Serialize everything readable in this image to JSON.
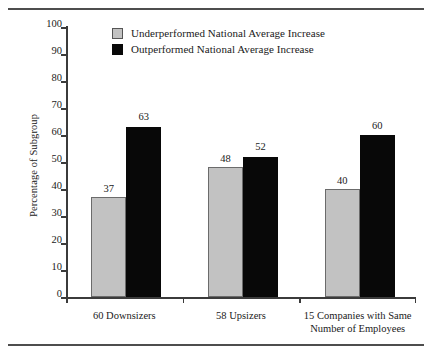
{
  "chart_data": {
    "type": "bar",
    "title": "",
    "subtitle": "",
    "xlabel": "",
    "ylabel": "Percentage of Subgroup",
    "ylim": [
      0,
      100
    ],
    "ytick_step": 10,
    "yticks": [
      0,
      10,
      20,
      30,
      40,
      50,
      60,
      70,
      80,
      90,
      100
    ],
    "grid": false,
    "legend_position": "top-center",
    "categories": [
      "60 Downsizers",
      "58 Upsizers",
      "15 Companies with Same Number of Employees"
    ],
    "category_lines": [
      [
        "60 Downsizers"
      ],
      [
        "58 Upsizers"
      ],
      [
        "15 Companies with Same",
        "Number of Employees"
      ]
    ],
    "series": [
      {
        "name": "Underperformed National Average Increase",
        "color": "#c2c2c2",
        "values": [
          37,
          48,
          40
        ]
      },
      {
        "name": "Outperformed National Average Increase",
        "color": "#080808",
        "values": [
          63,
          52,
          60
        ]
      }
    ]
  },
  "legend": {
    "items": [
      {
        "label": "Underperformed National Average Increase",
        "swatch": "under"
      },
      {
        "label": "Outperformed National Average Increase",
        "swatch": "over"
      }
    ]
  },
  "rules": {
    "top": "horizontal-rule-top",
    "bottom": "horizontal-rule-bottom"
  }
}
